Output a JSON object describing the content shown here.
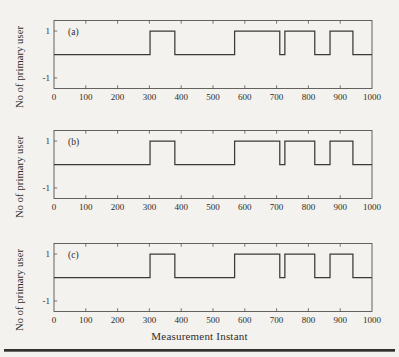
{
  "figure": {
    "background_color": "#f4f2ee",
    "line_color": "#3a3a38",
    "axis_color": "#55534f",
    "xlabel": "Measurement Instant",
    "ylabel": "No of primary user"
  },
  "panels": [
    {
      "tag": "(a)",
      "ylabel": "No of primary user"
    },
    {
      "tag": "(b)",
      "ylabel": "No of primary user"
    },
    {
      "tag": "(c)",
      "ylabel": "No of primary user"
    }
  ],
  "chart_data": {
    "type": "line",
    "title": "",
    "xlabel": "Measurement Instant",
    "ylabel": "No of primary user",
    "xlim": [
      0,
      1000
    ],
    "ylim": [
      -1.45,
      1.45
    ],
    "xticks": [
      0,
      100,
      200,
      300,
      400,
      500,
      600,
      700,
      800,
      900,
      1000
    ],
    "xticklabels": [
      "0",
      "100",
      "200",
      "300",
      "400",
      "500",
      "600",
      "700",
      "800",
      "900",
      "1000"
    ],
    "yticks": [
      -1,
      1
    ],
    "yticklabels": [
      "-1",
      "1"
    ],
    "grid": false,
    "legend": null,
    "drawstyle": "steps-post",
    "subplots": [
      {
        "name": "(a)",
        "x": [
          0,
          302,
          302,
          380,
          380,
          568,
          568,
          710,
          710,
          726,
          726,
          820,
          820,
          868,
          868,
          940,
          940,
          1000
        ],
        "y": [
          0,
          0,
          1,
          1,
          0,
          0,
          1,
          1,
          0,
          0,
          1,
          1,
          0,
          0,
          1,
          1,
          0,
          0
        ]
      },
      {
        "name": "(b)",
        "x": [
          0,
          302,
          302,
          380,
          380,
          568,
          568,
          710,
          710,
          726,
          726,
          820,
          820,
          868,
          868,
          940,
          940,
          1000
        ],
        "y": [
          0,
          0,
          1,
          1,
          0,
          0,
          1,
          1,
          0,
          0,
          1,
          1,
          0,
          0,
          1,
          1,
          0,
          0
        ]
      },
      {
        "name": "(c)",
        "x": [
          0,
          302,
          302,
          380,
          380,
          568,
          568,
          710,
          710,
          726,
          726,
          820,
          820,
          868,
          868,
          940,
          940,
          1000
        ],
        "y": [
          0,
          0,
          1,
          1,
          0,
          0,
          1,
          1,
          0,
          0,
          1,
          1,
          0,
          0,
          1,
          1,
          0,
          0
        ]
      }
    ]
  }
}
